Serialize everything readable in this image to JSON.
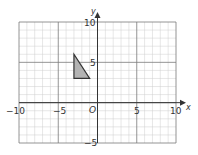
{
  "chart_data": {
    "type": "scatter",
    "title": "",
    "xlabel": "x",
    "ylabel": "y",
    "xlim": [
      -10,
      10
    ],
    "ylim": [
      -5,
      10
    ],
    "grid": true,
    "minor_grid_step": 1,
    "major_grid_step": 5,
    "x_ticks": [
      -10,
      -5,
      5,
      10
    ],
    "y_ticks": [
      10,
      5,
      -5
    ],
    "origin_label": "O",
    "shapes": [
      {
        "name": "triangle",
        "fill": "#b3b3b3",
        "stroke": "#333333",
        "vertices": [
          [
            -3,
            6
          ],
          [
            -3,
            3
          ],
          [
            -1,
            3
          ]
        ]
      }
    ]
  },
  "labels": {
    "x_axis": "x",
    "y_axis": "y",
    "origin": "O",
    "xt_m10": "−10",
    "xt_m5": "−5",
    "xt_5": "5",
    "xt_10": "10",
    "yt_10": "10",
    "yt_5": "5",
    "yt_m5": "−5"
  },
  "colors": {
    "minor_grid": "#cfcfcf",
    "major_grid": "#7a7a7a",
    "axis": "#333333",
    "text": "#333333"
  }
}
